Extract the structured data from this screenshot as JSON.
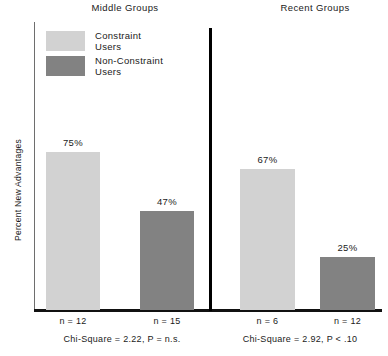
{
  "chart_data": {
    "type": "bar",
    "title": "",
    "xlabel": "",
    "ylabel": "Percent New Advantages",
    "ylim": [
      0,
      100
    ],
    "grid": false,
    "legend_position": "top-left",
    "panels": [
      {
        "name": "Middle Groups",
        "categories": [
          "Constraint Users",
          "Non-Constraint Users"
        ],
        "values": [
          75,
          47
        ],
        "value_labels": [
          "75%",
          "47%"
        ],
        "n_labels": [
          "n = 12",
          "n = 15"
        ],
        "stat": "Chi-Square = 2.22,  P = n.s."
      },
      {
        "name": "Recent Groups",
        "categories": [
          "Constraint Users",
          "Non-Constraint Users"
        ],
        "values": [
          67,
          25
        ],
        "value_labels": [
          "67%",
          "25%"
        ],
        "n_labels": [
          "n = 6",
          "n = 12"
        ],
        "stat": "Chi-Square = 2.92,  P < .10"
      }
    ],
    "series": [
      {
        "name": "Constraint Users",
        "values": [
          75,
          67
        ],
        "color": "#d2d2d2"
      },
      {
        "name": "Non-Constraint Users",
        "values": [
          47,
          25
        ],
        "color": "#828282"
      }
    ],
    "legend": [
      {
        "label_line1": "Constraint",
        "label_line2": "Users",
        "color": "#d2d2d2"
      },
      {
        "label_line1": "Non-Constraint",
        "label_line2": "Users",
        "color": "#828282"
      }
    ]
  },
  "colors": {
    "constraint": "#d2d2d2",
    "non_constraint": "#828282",
    "axis": "#6e6e6e",
    "baseline": "#111111",
    "divider": "#000000",
    "text": "#1a1a1a"
  }
}
